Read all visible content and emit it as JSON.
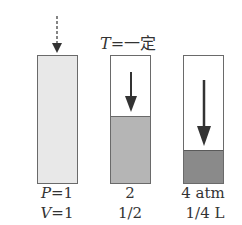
{
  "title": {
    "var": "T",
    "eq": "=",
    "text": "一定"
  },
  "cylinders": [
    {
      "fill_ratio": 1.0,
      "fill_color": "#e6e6e6",
      "arrow": "dashed"
    },
    {
      "fill_ratio": 0.5,
      "fill_color": "#b7b7b7",
      "arrow": "solid-medium"
    },
    {
      "fill_ratio": 0.25,
      "fill_color": "#888888",
      "arrow": "solid-long"
    }
  ],
  "labels": {
    "row1": [
      {
        "var": "P",
        "eq": "=",
        "value": "1"
      },
      {
        "value": "2"
      },
      {
        "value": "4 atm"
      }
    ],
    "row2": [
      {
        "var": "V",
        "eq": "=",
        "value": "1"
      },
      {
        "value": "1/2"
      },
      {
        "value": "1/4 L"
      }
    ]
  }
}
